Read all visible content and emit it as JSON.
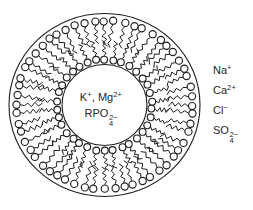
{
  "diagram": {
    "background": "#ffffff",
    "ink": "#1f1f1f",
    "membrane": {
      "center": {
        "x": 104.5,
        "y": 105
      },
      "outer_ring": {
        "rx": 95.5,
        "ry": 91.5
      },
      "inner_ring": {
        "rx": 42.5,
        "ry": 40.5
      },
      "outer_leaflet": {
        "count": 56,
        "head_ring_rx": 88,
        "head_ring_ry": 84,
        "head_radius": 3.6,
        "tail_length": 20,
        "tails_point": "inward"
      },
      "inner_leaflet": {
        "count": 34,
        "head_ring_rx": 47.5,
        "head_ring_ry": 45.5,
        "head_radius": 3.4,
        "tail_length": 15,
        "tails_point": "outward"
      }
    }
  },
  "intracellular_ions": {
    "line1": [
      {
        "t": "K"
      },
      {
        "sup": "+"
      },
      {
        "t": ", Mg"
      },
      {
        "sup": "2+"
      }
    ],
    "line2": [
      {
        "t": "RPO"
      },
      {
        "stack": {
          "sup": "2−",
          "sub": "4"
        }
      }
    ]
  },
  "extracellular_ions": [
    {
      "name": "sodium",
      "tokens": [
        {
          "t": "Na"
        },
        {
          "sup": "+"
        }
      ]
    },
    {
      "name": "calcium",
      "tokens": [
        {
          "t": "Ca"
        },
        {
          "sup": "2+"
        }
      ]
    },
    {
      "name": "chloride",
      "tokens": [
        {
          "t": "Cl"
        },
        {
          "sup": "−"
        }
      ]
    },
    {
      "name": "sulfate",
      "tokens": [
        {
          "t": "SO"
        },
        {
          "stack": {
            "sup": "2−",
            "sub": "4"
          }
        }
      ]
    }
  ]
}
